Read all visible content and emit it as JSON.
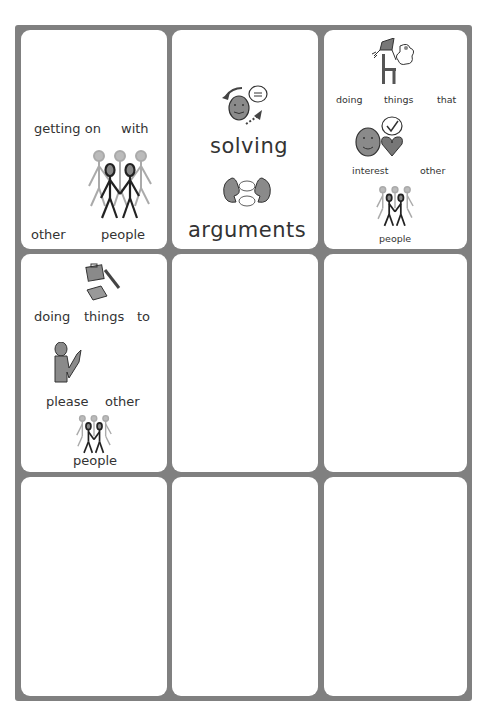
{
  "worksheet": {
    "cards": [
      {
        "id": "card-1",
        "words": [
          "getting on",
          "with",
          "other",
          "people"
        ],
        "symbols": [
          "group-of-people-icon"
        ]
      },
      {
        "id": "card-2",
        "words": [
          "solving",
          "arguments"
        ],
        "symbols": [
          "problem-solving-face-icon",
          "two-heads-arguing-icon"
        ]
      },
      {
        "id": "card-3",
        "words": [
          "doing",
          "things",
          "that",
          "interest",
          "other",
          "people"
        ],
        "symbols": [
          "kite-chair-hobbies-icon",
          "face-thought-heart-icon",
          "group-of-people-icon"
        ]
      },
      {
        "id": "card-4",
        "words": [
          "doing",
          "things",
          "to",
          "please",
          "other",
          "people"
        ],
        "symbols": [
          "briefcase-laptop-pen-icon",
          "person-praying-icon",
          "group-of-people-icon"
        ]
      },
      {
        "id": "card-5",
        "words": [],
        "symbols": []
      },
      {
        "id": "card-6",
        "words": [],
        "symbols": []
      },
      {
        "id": "card-7",
        "words": [],
        "symbols": []
      },
      {
        "id": "card-8",
        "words": [],
        "symbols": []
      },
      {
        "id": "card-9",
        "words": [],
        "symbols": []
      }
    ],
    "colors": {
      "frame": "#808080",
      "card": "#ffffff",
      "text": "#333333",
      "symbol_fill": "#8a8a8a",
      "symbol_light": "#aaaaaa"
    }
  }
}
